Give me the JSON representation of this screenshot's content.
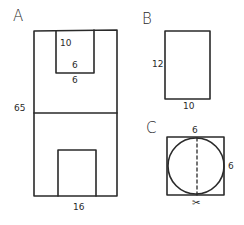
{
  "figures": {
    "A": {
      "label": "A",
      "upper_inner_height": "10",
      "upper_inner_width": "6",
      "upper_inner_offset": "6",
      "height": "65",
      "width": "16"
    },
    "B": {
      "label": "B",
      "height": "12",
      "width": "10"
    },
    "C": {
      "label": "C",
      "top": "6",
      "side": "6",
      "scissors": "✂"
    }
  },
  "colors": {
    "stroke": "#2a2a2a",
    "background": "#ffffff"
  }
}
